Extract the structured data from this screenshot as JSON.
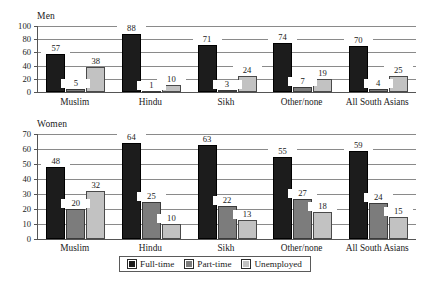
{
  "chart_data": [
    {
      "type": "bar",
      "title": "Men",
      "categories": [
        "Muslim",
        "Hindu",
        "Sikh",
        "Other/none",
        "All South Asians"
      ],
      "series": [
        {
          "name": "Full-time",
          "color": "#1c1c1c",
          "values": [
            57,
            88,
            71,
            74,
            70
          ]
        },
        {
          "name": "Part-time",
          "color": "#7c7c7c",
          "values": [
            5,
            1,
            3,
            7,
            4
          ]
        },
        {
          "name": "Unemployed",
          "color": "#c2c2c2",
          "values": [
            38,
            10,
            24,
            19,
            25
          ]
        }
      ],
      "xlabel": "",
      "ylabel": "",
      "ylim": [
        0,
        100
      ],
      "yticks": [
        0,
        20,
        40,
        60,
        80,
        100
      ],
      "grid": true,
      "data_labels": true,
      "legend_position": "bottom"
    },
    {
      "type": "bar",
      "title": "Women",
      "categories": [
        "Muslim",
        "Hindu",
        "Sikh",
        "Other/none",
        "All South Asians"
      ],
      "series": [
        {
          "name": "Full-time",
          "color": "#1c1c1c",
          "values": [
            48,
            64,
            63,
            55,
            59
          ]
        },
        {
          "name": "Part-time",
          "color": "#7c7c7c",
          "values": [
            20,
            25,
            22,
            27,
            24
          ]
        },
        {
          "name": "Unemployed",
          "color": "#c2c2c2",
          "values": [
            32,
            10,
            13,
            18,
            15
          ]
        }
      ],
      "xlabel": "",
      "ylabel": "",
      "ylim": [
        0,
        70
      ],
      "yticks": [
        0,
        10,
        20,
        30,
        40,
        50,
        60,
        70
      ],
      "grid": true,
      "data_labels": true,
      "legend_position": "bottom"
    }
  ],
  "legend": {
    "items": [
      {
        "label": "Full-time",
        "key": "ft"
      },
      {
        "label": "Part-time",
        "key": "pt"
      },
      {
        "label": "Unemployed",
        "key": "un"
      }
    ]
  }
}
